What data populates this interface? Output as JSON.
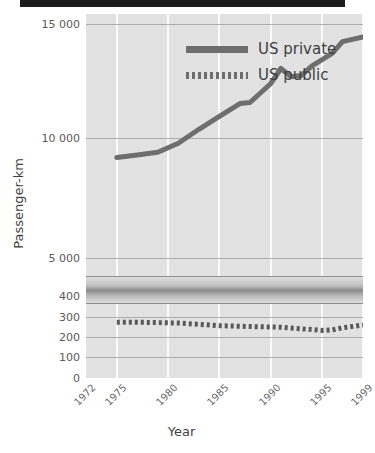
{
  "chart_data": {
    "type": "line",
    "title": "",
    "xlabel": "Year",
    "ylabel": "Passenger-km",
    "grid": true,
    "legend_position": "top-left",
    "broken_axis": true,
    "x": [
      1972,
      1975,
      1980,
      1985,
      1990,
      1995,
      1999
    ],
    "xlim": [
      1972,
      1999
    ],
    "xticklabels": [
      "1972",
      "1975",
      "1980",
      "1985",
      "1990",
      "1995",
      "1999"
    ],
    "yticklabels": [
      "0",
      "100",
      "200",
      "300",
      "400",
      "5 000",
      "10 000",
      "15 000"
    ],
    "ylim_lower": [
      0,
      400
    ],
    "ylim_upper": [
      5000,
      15000
    ],
    "series": [
      {
        "name": "US private",
        "style": "solid",
        "color": "#6e6e6e",
        "points": [
          {
            "x": 1975,
            "y": 9300
          },
          {
            "x": 1977,
            "y": 9400
          },
          {
            "x": 1979,
            "y": 9520
          },
          {
            "x": 1981,
            "y": 9900
          },
          {
            "x": 1983,
            "y": 10500
          },
          {
            "x": 1985,
            "y": 11050
          },
          {
            "x": 1987,
            "y": 11600
          },
          {
            "x": 1988,
            "y": 11650
          },
          {
            "x": 1989,
            "y": 12050
          },
          {
            "x": 1990,
            "y": 12450
          },
          {
            "x": 1991,
            "y": 13100
          },
          {
            "x": 1992,
            "y": 12750
          },
          {
            "x": 1993,
            "y": 12800
          },
          {
            "x": 1994,
            "y": 13200
          },
          {
            "x": 1996,
            "y": 13750
          },
          {
            "x": 1997,
            "y": 14250
          },
          {
            "x": 1999,
            "y": 14450
          }
        ]
      },
      {
        "name": "US public",
        "style": "dotted",
        "color": "#585858",
        "points": [
          {
            "x": 1975,
            "y": 272
          },
          {
            "x": 1977,
            "y": 272
          },
          {
            "x": 1979,
            "y": 270
          },
          {
            "x": 1981,
            "y": 268
          },
          {
            "x": 1983,
            "y": 262
          },
          {
            "x": 1985,
            "y": 255
          },
          {
            "x": 1987,
            "y": 252
          },
          {
            "x": 1989,
            "y": 250
          },
          {
            "x": 1991,
            "y": 248
          },
          {
            "x": 1993,
            "y": 240
          },
          {
            "x": 1995,
            "y": 232
          },
          {
            "x": 1996,
            "y": 234
          },
          {
            "x": 1997,
            "y": 245
          },
          {
            "x": 1999,
            "y": 258
          }
        ]
      }
    ]
  },
  "legend": {
    "entries": [
      {
        "label": "US private",
        "style": "solid"
      },
      {
        "label": "US public",
        "style": "dotted"
      }
    ]
  },
  "colors": {
    "plot_background": "#e2e2e2",
    "gridline": "#fbfbfb",
    "series_private": "#6e6e6e",
    "series_public": "#585858",
    "text": "#3f3f3f",
    "top_bar": "#1c1c1c"
  }
}
